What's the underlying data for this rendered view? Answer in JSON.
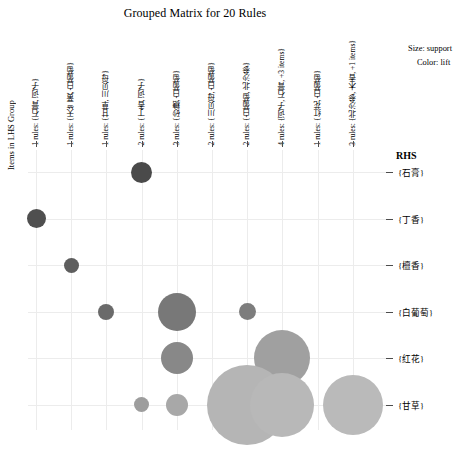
{
  "title": "Grouped Matrix for 20 Rules",
  "axis": {
    "ylabel": "Items in LHS Group",
    "rhs_header": "RHS"
  },
  "legend": {
    "size_line": "Size: support",
    "color_line": "Color: lift"
  },
  "chart_data": {
    "type": "scatter",
    "title": "Grouped Matrix for 20 Rules",
    "xlabel": "",
    "ylabel": "Items in LHS Group",
    "grid": true,
    "legend_position": "top-right",
    "size_encodes": "support",
    "color_encodes": "lift",
    "x_categories": [
      "1 rules: {石膏, 诃子}",
      "1 rules: {天竺黄, 白葡萄}",
      "1 rules: {甘草, 川贝母}",
      "2 rules: {丁香, 诃子}",
      "3 rules: {砂糖, 白葡萄}",
      "2 rules: {川贝母, 白葡萄}",
      "2 rules: {白葡萄, 北沙参}",
      "4 rules: {诃子, 石膏, +3 items}",
      "1 rules: {红花, 白葡萄}",
      "3 rules: {北沙参, 木香, +1 items}"
    ],
    "x_rule_counts": [
      1,
      1,
      1,
      2,
      3,
      2,
      2,
      4,
      1,
      3
    ],
    "y_categories": [
      "{石膏}",
      "{丁香}",
      "{檀香}",
      "{白葡萄}",
      "{红花}",
      "{甘草}"
    ],
    "bubbles": [
      {
        "x": 4,
        "y": "{石膏}",
        "support": 0.14,
        "lift": 0.92,
        "color": "#4a4a4a",
        "r": 10.5
      },
      {
        "x": 1,
        "y": "{丁香}",
        "support": 0.13,
        "lift": 0.9,
        "color": "#4f4f4f",
        "r": 9.5
      },
      {
        "x": 2,
        "y": "{檀香}",
        "support": 0.09,
        "lift": 0.85,
        "color": "#5e5e5e",
        "r": 7.5
      },
      {
        "x": 3,
        "y": "{白葡萄}",
        "support": 0.1,
        "lift": 0.8,
        "color": "#6a6a6a",
        "r": 8.0
      },
      {
        "x": 5,
        "y": "{白葡萄}",
        "support": 0.3,
        "lift": 0.74,
        "color": "#787878",
        "r": 19.0
      },
      {
        "x": 7,
        "y": "{白葡萄}",
        "support": 0.1,
        "lift": 0.72,
        "color": "#7d7d7d",
        "r": 8.5
      },
      {
        "x": 5,
        "y": "{红花}",
        "support": 0.24,
        "lift": 0.68,
        "color": "#888888",
        "r": 16.0
      },
      {
        "x": 8,
        "y": "{红花}",
        "support": 0.52,
        "lift": 0.58,
        "color": "#a0a0a0",
        "r": 28.0
      },
      {
        "x": 4,
        "y": "{甘草}",
        "support": 0.09,
        "lift": 0.6,
        "color": "#9d9d9d",
        "r": 7.5
      },
      {
        "x": 5,
        "y": "{甘草}",
        "support": 0.15,
        "lift": 0.56,
        "color": "#a8a8a8",
        "r": 11.0
      },
      {
        "x": 7,
        "y": "{甘草}",
        "support": 0.68,
        "lift": 0.46,
        "color": "#b5b5b5",
        "r": 40.0
      },
      {
        "x": 8,
        "y": "{甘草}",
        "support": 0.5,
        "lift": 0.45,
        "color": "#b8b8b8",
        "r": 32.0
      },
      {
        "x": 10,
        "y": "{甘草}",
        "support": 0.46,
        "lift": 0.44,
        "color": "#bababa",
        "r": 30.0
      }
    ]
  }
}
